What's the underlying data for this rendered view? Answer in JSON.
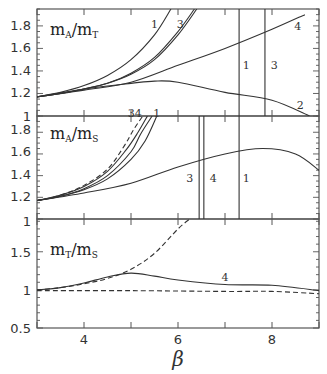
{
  "chart_data": {
    "type": "line",
    "xlabel": "β",
    "xlim": [
      3,
      9
    ],
    "xticks": [
      4,
      6,
      8
    ],
    "grid": false,
    "panels": [
      {
        "label_main": "m",
        "label_sub1": "A",
        "label_sep": "/",
        "label_main2": "m",
        "label_sub2": "T",
        "title": "mA/mT",
        "ylim": [
          1,
          1.95
        ],
        "yticks": [
          1,
          1.2,
          1.4,
          1.6,
          1.8
        ],
        "series": [
          {
            "name": "1",
            "x": [
              3,
              3.5,
              4,
              4.5,
              5,
              5.5,
              5.85
            ],
            "y": [
              1.17,
              1.21,
              1.27,
              1.36,
              1.5,
              1.72,
              1.95
            ]
          },
          {
            "name": "3",
            "x": [
              3,
              3.5,
              4,
              4.5,
              5,
              5.5,
              6.0,
              6.35
            ],
            "y": [
              1.17,
              1.2,
              1.24,
              1.29,
              1.38,
              1.52,
              1.75,
              1.95
            ]
          },
          {
            "name": "3b",
            "x": [
              3,
              3.5,
              4,
              4.5,
              5,
              5.5,
              6.0,
              6.4
            ],
            "y": [
              1.17,
              1.2,
              1.24,
              1.29,
              1.37,
              1.5,
              1.72,
              1.95
            ]
          },
          {
            "name": "4",
            "x": [
              3,
              4,
              5,
              6,
              7,
              8,
              8.7
            ],
            "y": [
              1.17,
              1.23,
              1.3,
              1.45,
              1.6,
              1.77,
              1.9
            ]
          },
          {
            "name": "2",
            "x": [
              3,
              4,
              5,
              5.5,
              6,
              7,
              8,
              8.8
            ],
            "y": [
              1.17,
              1.24,
              1.29,
              1.31,
              1.3,
              1.21,
              1.14,
              1.0
            ]
          },
          {
            "name": "1-vertical",
            "x": [
              7.3,
              7.3
            ],
            "y": [
              1.0,
              1.95
            ]
          },
          {
            "name": "3-vertical",
            "x": [
              7.85,
              7.85
            ],
            "y": [
              1.0,
              1.95
            ]
          }
        ],
        "annotations": [
          {
            "text": "1",
            "x": 5.5,
            "y": 1.82
          },
          {
            "text": "3",
            "x": 6.05,
            "y": 1.82
          },
          {
            "text": "4",
            "x": 8.55,
            "y": 1.8
          },
          {
            "text": "1",
            "x": 7.45,
            "y": 1.45
          },
          {
            "text": "3",
            "x": 8.05,
            "y": 1.45
          },
          {
            "text": "2",
            "x": 8.6,
            "y": 1.1
          },
          {
            "text": "34",
            "x": 5.08,
            "y": 1.03
          },
          {
            "text": "1",
            "x": 5.55,
            "y": 1.03
          }
        ]
      },
      {
        "label_main": "m",
        "label_sub1": "A",
        "label_sep": "/",
        "label_main2": "m",
        "label_sub2": "S",
        "title": "mA/mS",
        "ylim": [
          1,
          1.95
        ],
        "yticks": [
          1,
          1.2,
          1.4,
          1.6,
          1.8
        ],
        "series": [
          {
            "name": "1",
            "x": [
              3,
              3.5,
              4,
              4.5,
              5,
              5.3,
              5.55
            ],
            "y": [
              1.17,
              1.21,
              1.27,
              1.37,
              1.55,
              1.72,
              1.95
            ]
          },
          {
            "name": "3",
            "x": [
              3,
              3.5,
              4,
              4.5,
              5,
              5.2,
              5.45
            ],
            "y": [
              1.17,
              1.21,
              1.28,
              1.4,
              1.62,
              1.78,
              1.95
            ]
          },
          {
            "name": "4",
            "x": [
              3,
              3.5,
              4,
              4.5,
              4.9,
              5.15,
              5.35
            ],
            "y": [
              1.17,
              1.22,
              1.3,
              1.44,
              1.64,
              1.8,
              1.95
            ]
          },
          {
            "name": "dashed",
            "x": [
              3,
              3.5,
              4,
              4.5,
              4.85,
              5.05,
              5.25
            ],
            "y": [
              1.17,
              1.22,
              1.31,
              1.46,
              1.67,
              1.82,
              1.95
            ]
          },
          {
            "name": "main",
            "x": [
              3,
              4,
              5,
              6,
              7,
              7.8,
              8.5,
              9
            ],
            "y": [
              1.17,
              1.24,
              1.33,
              1.48,
              1.6,
              1.65,
              1.6,
              1.45
            ]
          },
          {
            "name": "3-vertical",
            "x": [
              6.45,
              6.45
            ],
            "y": [
              1.0,
              1.95
            ]
          },
          {
            "name": "4-vertical",
            "x": [
              6.55,
              6.55
            ],
            "y": [
              1.0,
              1.95
            ]
          },
          {
            "name": "1-vertical",
            "x": [
              7.3,
              7.3
            ],
            "y": [
              1.0,
              1.95
            ]
          }
        ],
        "annotations": [
          {
            "text": "3",
            "x": 6.25,
            "y": 1.38
          },
          {
            "text": "4",
            "x": 6.75,
            "y": 1.38
          },
          {
            "text": "1",
            "x": 7.45,
            "y": 1.38
          }
        ]
      },
      {
        "label_main": "m",
        "label_sub1": "T",
        "label_sep": "/",
        "label_main2": "m",
        "label_sub2": "S",
        "title": "mT/mS",
        "ylim": [
          0.5,
          1.93
        ],
        "yticks": [
          0.5,
          1,
          1.5
        ],
        "series": [
          {
            "name": "dashed-rising",
            "x": [
              3,
              3.5,
              4,
              4.5,
              5,
              5.5,
              6.0,
              6.25
            ],
            "y": [
              1.0,
              1.03,
              1.08,
              1.15,
              1.27,
              1.48,
              1.8,
              1.93
            ]
          },
          {
            "name": "4",
            "x": [
              3,
              3.5,
              4,
              4.5,
              5,
              5.5,
              6,
              7,
              8,
              9
            ],
            "y": [
              1.0,
              1.03,
              1.09,
              1.17,
              1.22,
              1.18,
              1.13,
              1.07,
              1.06,
              0.99
            ]
          },
          {
            "name": "dashed-flat",
            "x": [
              3,
              5,
              7,
              8,
              9
            ],
            "y": [
              0.99,
              0.99,
              0.98,
              0.98,
              0.95
            ]
          }
        ],
        "annotations": [
          {
            "text": "4",
            "x": 7.0,
            "y": 1.17
          }
        ]
      }
    ]
  },
  "axes": {
    "xlabel": "β",
    "xtick_labels": [
      "4",
      "6",
      "8"
    ],
    "panel1_ytick_labels": [
      "1.8",
      "1.6",
      "1.4",
      "1.2",
      "1"
    ],
    "panel2_ytick_labels": [
      "1.8",
      "1.6",
      "1.4",
      "1.2",
      "1"
    ],
    "panel3_ytick_labels": [
      "1.5",
      "1",
      "0.5"
    ]
  }
}
